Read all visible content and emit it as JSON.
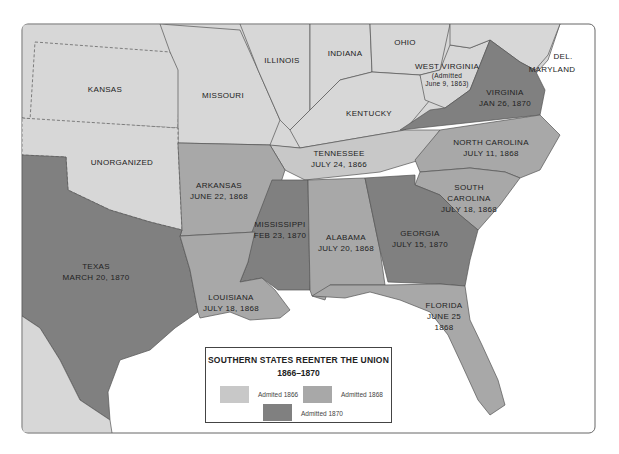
{
  "map": {
    "title": "SOUTHERN STATES REENTER THE UNION",
    "years": "1866–1870",
    "colors": {
      "non_seceded": "#d7d7d7",
      "admitted_1866": "#c8c8c8",
      "admitted_1868": "#a8a8a8",
      "admitted_1870": "#808080",
      "water": "#ffffff",
      "border": "#555555"
    },
    "states": [
      {
        "name": "KANSAS",
        "date": ""
      },
      {
        "name": "MISSOURI",
        "date": ""
      },
      {
        "name": "ILLINOIS",
        "date": ""
      },
      {
        "name": "INDIANA",
        "date": ""
      },
      {
        "name": "OHIO",
        "date": ""
      },
      {
        "name": "WEST VIRGINIA",
        "date": "",
        "note_line1": "(Admitted",
        "note_line2": "June 9, 1863)"
      },
      {
        "name": "DEL.",
        "date": ""
      },
      {
        "name": "MARYLAND",
        "date": ""
      },
      {
        "name": "VIRGINIA",
        "date": "JAN 26, 1870"
      },
      {
        "name": "KENTUCKY",
        "date": ""
      },
      {
        "name": "UNORGANIZED",
        "date": ""
      },
      {
        "name": "TENNESSEE",
        "date": "JULY 24, 1866"
      },
      {
        "name": "NORTH CAROLINA",
        "date": "JULY 11, 1868"
      },
      {
        "name": "ARKANSAS",
        "date": "JUNE 22, 1868"
      },
      {
        "name": "SOUTH",
        "name2": "CAROLINA",
        "date": "JULY 18, 1868"
      },
      {
        "name": "MISSISSIPPI",
        "date": "FEB 23, 1870"
      },
      {
        "name": "ALABAMA",
        "date": "JULY 20, 1868"
      },
      {
        "name": "GEORGIA",
        "date": "JULY 15, 1870"
      },
      {
        "name": "TEXAS",
        "date": "MARCH 20, 1870"
      },
      {
        "name": "LOUISIANA",
        "date": "JULY 18, 1868"
      },
      {
        "name": "FLORIDA",
        "date": "JUNE 25",
        "date2": "1868"
      }
    ],
    "legend": [
      {
        "label": "Admited 1866"
      },
      {
        "label": "Admitted 1868"
      },
      {
        "label": "Admitted 1870"
      }
    ]
  }
}
